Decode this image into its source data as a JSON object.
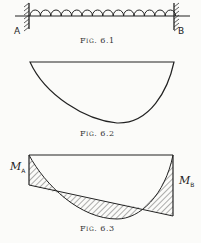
{
  "figures": [
    {
      "id": "fig-6-1",
      "caption": "Fig. 6.1",
      "description": "Fixed-end beam with uniformly distributed load",
      "support_left_label": "A",
      "support_right_label": "B",
      "load_arc_count": 14
    },
    {
      "id": "fig-6-2",
      "caption": "Fig. 6.2",
      "description": "Free bending moment diagram (asymmetric parabola)"
    },
    {
      "id": "fig-6-3",
      "caption": "Fig. 6.3",
      "description": "Combined free and fixing moment diagrams with hatched net areas",
      "moment_left_label": "M",
      "moment_left_sub": "A",
      "moment_right_label": "M",
      "moment_right_sub": "B"
    }
  ],
  "colors": {
    "ink": "#222222",
    "background": "#fbfbf9"
  }
}
